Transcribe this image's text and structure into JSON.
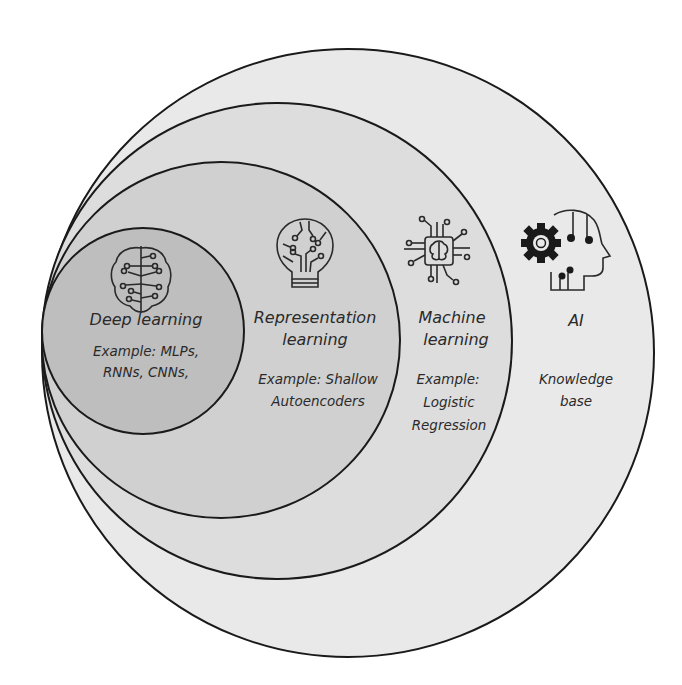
{
  "diagram": {
    "type": "nested-ellipses",
    "colors": {
      "background": "#ffffff",
      "ai": "#e9e9e9",
      "ml": "#dddddd",
      "rl": "#d0d0d0",
      "dl": "#bebebe",
      "stroke": "#1a1a1a"
    },
    "regions": [
      {
        "id": "ai",
        "title": "AI",
        "example_lines": [
          "Knowledge",
          "base"
        ],
        "icon": "gear-head-icon"
      },
      {
        "id": "ml",
        "title_lines": [
          "Machine",
          "learning"
        ],
        "example_lines": [
          "Example:",
          "Logistic",
          "Regression"
        ],
        "icon": "chip-brain-icon"
      },
      {
        "id": "rl",
        "title_lines": [
          "Representation",
          "learning"
        ],
        "example_lines": [
          "Example: Shallow",
          "Autoencoders"
        ],
        "icon": "lightbulb-circuit-icon"
      },
      {
        "id": "dl",
        "title": "Deep learning",
        "example_lines": [
          "Example: MLPs,",
          "RNNs, CNNs,"
        ],
        "icon": "brain-circuit-icon"
      }
    ]
  }
}
